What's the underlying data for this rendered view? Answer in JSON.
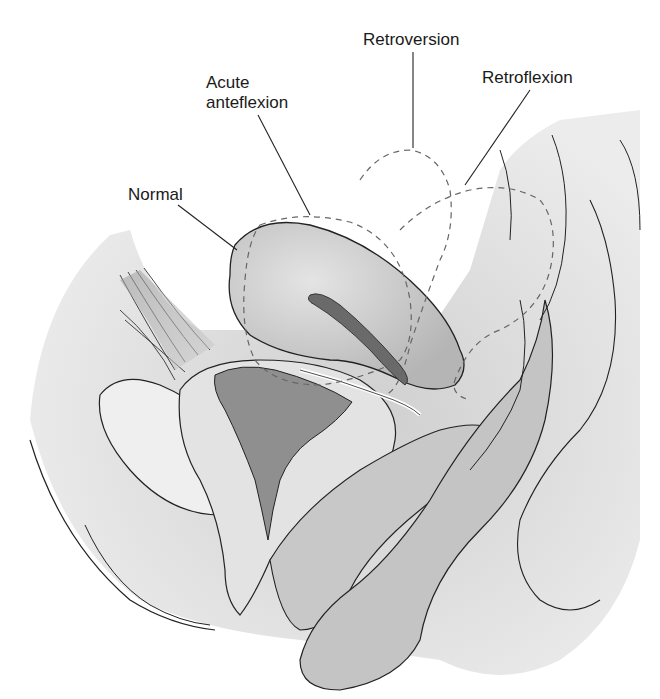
{
  "figure": {
    "labels": {
      "normal": "Normal",
      "acute_anteflexion_line1": "Acute",
      "acute_anteflexion_line2": "anteflexion",
      "retroversion": "Retroversion",
      "retroflexion": "Retroflexion"
    },
    "colors": {
      "tissue_light": "#d9d9d9",
      "tissue_mid": "#bdbdbd",
      "tissue_dark": "#8e8e8e",
      "outline": "#222222",
      "dashed_outline": "#666666"
    }
  }
}
